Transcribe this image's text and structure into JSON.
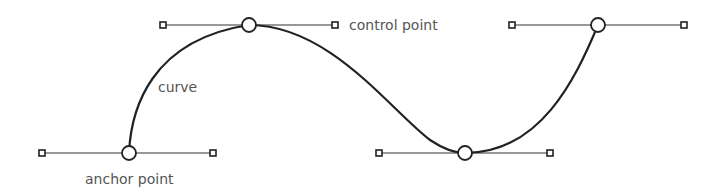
{
  "diagram": {
    "colors": {
      "stroke": "#222222",
      "handle_line": "#333333",
      "label": "#555555",
      "background": "#ffffff"
    },
    "labels": {
      "curve": "curve",
      "control_point": "control point",
      "anchor_point": "anchor point"
    },
    "anchors": [
      {
        "x": 129,
        "y": 153,
        "handle_in": {
          "x": 42,
          "y": 153
        },
        "handle_out": {
          "x": 213,
          "y": 153
        }
      },
      {
        "x": 249,
        "y": 25,
        "handle_in": {
          "x": 163,
          "y": 25
        },
        "handle_out": {
          "x": 335,
          "y": 25
        }
      },
      {
        "x": 465,
        "y": 153,
        "handle_in": {
          "x": 379,
          "y": 153
        },
        "handle_out": {
          "x": 550,
          "y": 153
        }
      },
      {
        "x": 598,
        "y": 25,
        "handle_in": {
          "x": 512,
          "y": 25
        },
        "handle_out": {
          "x": 684,
          "y": 25
        }
      }
    ]
  }
}
